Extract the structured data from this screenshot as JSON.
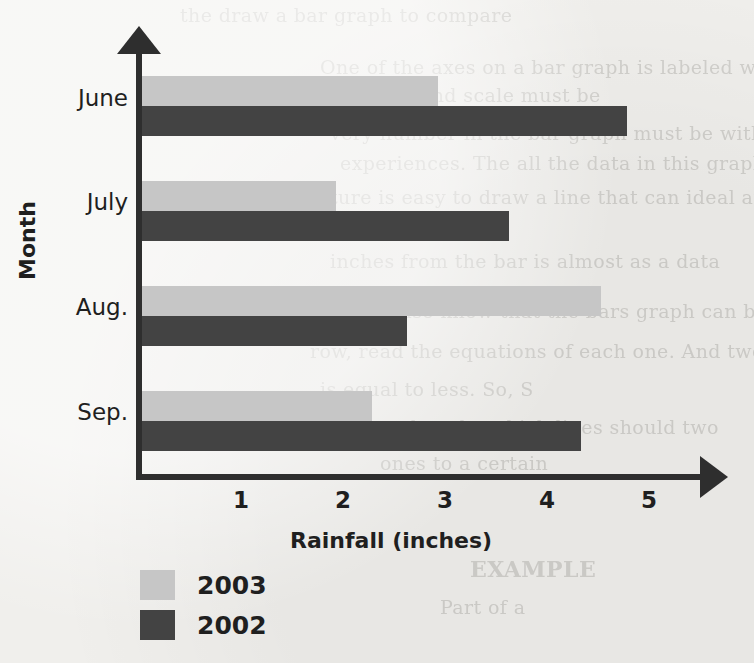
{
  "chart_data": {
    "type": "bar",
    "orientation": "horizontal",
    "title": "",
    "xlabel": "Rainfall (inches)",
    "ylabel": "Month",
    "categories": [
      "June",
      "July",
      "Aug.",
      "Sep."
    ],
    "series": [
      {
        "name": "2003",
        "color": "#c6c6c6",
        "values": [
          2.9,
          1.9,
          4.5,
          2.25
        ]
      },
      {
        "name": "2002",
        "color": "#434343",
        "values": [
          4.75,
          3.6,
          2.6,
          4.3
        ]
      }
    ],
    "xlim": [
      0,
      5.6
    ],
    "xticks": [
      1,
      2,
      3,
      4,
      5
    ],
    "xtick_labels": [
      "1",
      "2",
      "3",
      "4",
      "5"
    ],
    "grid": false,
    "legend_position": "bottom-left"
  },
  "legend": {
    "items": [
      {
        "label": "2003",
        "color": "#c6c6c6"
      },
      {
        "label": "2002",
        "color": "#434343"
      }
    ]
  },
  "background_text": [
    "the draw a bar graph to compare",
    "One of the axes on a bar graph is labeled with numbers. A",
    "and scale must be",
    "very number in the bar graph must be within the",
    "experiences.  The all the data in this graph is in",
    "picture is easy to draw a line that can ideal and",
    "inches from the bar is almost as a data",
    "numbers also know that the bars graph can be",
    "row, read the equations of each one. And two",
    "is equal to less. So, S",
    "in the graph make which lines should two",
    "ones to a certain",
    "EXAMPLE",
    "Part of a"
  ]
}
